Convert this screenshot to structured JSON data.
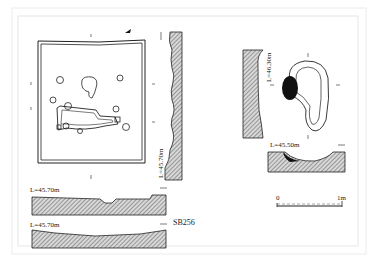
{
  "figure": {
    "feature_id": "SB256",
    "plan_north_arrow": "north-arrow",
    "section_labels": {
      "left_vertical": "L=45.70m",
      "section_1": "L=45.70m",
      "section_2": "L=45.70m",
      "pit_vertical": "L=46.30m",
      "pit_horizontal": "L=45.50m"
    },
    "scale_bar": {
      "start": "0",
      "end": "1m"
    },
    "colors": {
      "line": "#222222",
      "hatch": "#555555",
      "fill_dark": "#111111",
      "background": "#ffffff"
    }
  }
}
